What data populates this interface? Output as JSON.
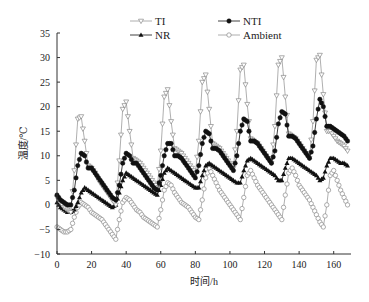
{
  "chart_data": {
    "type": "line",
    "title": "",
    "xlabel": "时间/h",
    "ylabel": "温度/℃",
    "xlim": [
      0,
      170
    ],
    "ylim": [
      -10,
      35
    ],
    "xticks": [
      0,
      20,
      40,
      60,
      80,
      100,
      120,
      140,
      160
    ],
    "yticks": [
      -10,
      -5,
      0,
      5,
      10,
      15,
      20,
      25,
      30,
      35
    ],
    "grid": false,
    "legend_position": "top",
    "x": [
      0,
      2,
      4,
      6,
      8,
      10,
      12,
      14,
      16,
      18,
      20,
      22,
      24,
      26,
      28,
      30,
      32,
      34,
      36,
      38,
      40,
      42,
      44,
      46,
      48,
      50,
      52,
      54,
      56,
      58,
      60,
      62,
      64,
      66,
      68,
      70,
      72,
      74,
      76,
      78,
      80,
      82,
      84,
      86,
      88,
      90,
      92,
      94,
      96,
      98,
      100,
      102,
      104,
      106,
      108,
      110,
      112,
      114,
      116,
      118,
      120,
      122,
      124,
      126,
      128,
      130,
      132,
      134,
      136,
      138,
      140,
      142,
      144,
      146,
      148,
      150,
      152,
      154,
      156,
      158,
      160,
      162,
      164,
      166,
      168
    ],
    "series": [
      {
        "name": "TI",
        "marker": "open-triangle-down",
        "values": [
          1.5,
          0.5,
          -0.5,
          -1,
          -1.5,
          7,
          17.5,
          18,
          13,
          8,
          7.5,
          6.5,
          5,
          4,
          3,
          2,
          1,
          0,
          9,
          19.5,
          21,
          15,
          9.5,
          9,
          8.5,
          7.5,
          6.5,
          5.5,
          4.5,
          3.5,
          11,
          22,
          23.5,
          17,
          11.5,
          11,
          10.5,
          9.5,
          8.5,
          7.5,
          6.5,
          13,
          25,
          26.5,
          19.5,
          12.5,
          12,
          11.5,
          10.5,
          9.5,
          8.5,
          7.5,
          15,
          27.5,
          28.5,
          20.5,
          13.5,
          13,
          12.5,
          11.5,
          10.5,
          9.5,
          8.5,
          16,
          28.5,
          30,
          22,
          14.5,
          14,
          13.5,
          12.5,
          11.5,
          10.5,
          9.5,
          17,
          29.5,
          30.5,
          22.5,
          15,
          15,
          14,
          13,
          12.5,
          12,
          11
        ]
      },
      {
        "name": "NTI",
        "marker": "filled-circle",
        "values": [
          2,
          1,
          0.5,
          0,
          0,
          3,
          8,
          10.5,
          10,
          7.5,
          7.5,
          6.5,
          5.5,
          4.5,
          3.5,
          2.5,
          1.5,
          1,
          4,
          8.5,
          10.5,
          10,
          8.5,
          8.5,
          7.5,
          6.5,
          5.5,
          4.5,
          3.5,
          3,
          6,
          10,
          12.5,
          12.5,
          10,
          10,
          9.5,
          8.5,
          7.5,
          6.5,
          5.5,
          8,
          12.5,
          15,
          14.5,
          11.5,
          11.5,
          11,
          10,
          9,
          8,
          7,
          10,
          15,
          17.5,
          17,
          13,
          13,
          12.5,
          11.5,
          10.5,
          9.5,
          8.5,
          11,
          16.5,
          19,
          18.5,
          14,
          14,
          13.5,
          12.5,
          11.5,
          10.5,
          9.5,
          12,
          17.5,
          21.5,
          20,
          16,
          16,
          15.5,
          15,
          14.5,
          14,
          13
        ]
      },
      {
        "name": "NR",
        "marker": "filled-triangle-up",
        "values": [
          0.5,
          -0.5,
          -1,
          -1.5,
          -1.5,
          -1,
          0.5,
          2.5,
          3.5,
          3,
          2.5,
          2,
          1.5,
          1,
          0.5,
          0,
          -0.5,
          0,
          2.5,
          5,
          6.5,
          6,
          5.5,
          5,
          4.5,
          4,
          3.5,
          3,
          2.5,
          2,
          4,
          6.5,
          7.5,
          7,
          6.5,
          6,
          5.5,
          5,
          4.5,
          4,
          3.5,
          3.5,
          6,
          8,
          8.5,
          8,
          7.5,
          7,
          6.5,
          6,
          5.5,
          5,
          4.5,
          4.5,
          7,
          9,
          9.5,
          9,
          8.5,
          8,
          7.5,
          7,
          6.5,
          6,
          5,
          5,
          7.5,
          9.5,
          9.5,
          9,
          8.5,
          8,
          7.5,
          7,
          6.5,
          6,
          5,
          5.5,
          8,
          9.5,
          9.5,
          9,
          8.5,
          8.5,
          8
        ]
      },
      {
        "name": "Ambient",
        "marker": "open-circle",
        "values": [
          -4.5,
          -5,
          -5.5,
          -5.5,
          -5,
          -2.5,
          -0.5,
          0.5,
          0,
          -0.5,
          -1.5,
          -2,
          -2.5,
          -3,
          -4,
          -5,
          -6,
          -7,
          -3,
          0.5,
          1.5,
          1,
          0,
          -1,
          -1.5,
          -2.5,
          -3,
          -3.5,
          -4,
          -4.5,
          -1,
          3,
          4.5,
          4,
          2.5,
          1.5,
          0.5,
          0,
          -0.5,
          -1.5,
          -2.5,
          -3,
          1,
          5.5,
          7.5,
          6,
          4.5,
          3,
          2,
          1,
          0,
          -1,
          -2,
          -3,
          1.5,
          6,
          7,
          5.5,
          4,
          3,
          2,
          1,
          0,
          -1,
          -2,
          -3,
          2,
          6.5,
          7.5,
          6,
          4,
          3,
          2,
          1,
          -0.5,
          -2,
          -3.5,
          -4.5,
          0,
          6,
          7,
          5,
          3,
          1.5,
          0
        ]
      }
    ]
  }
}
